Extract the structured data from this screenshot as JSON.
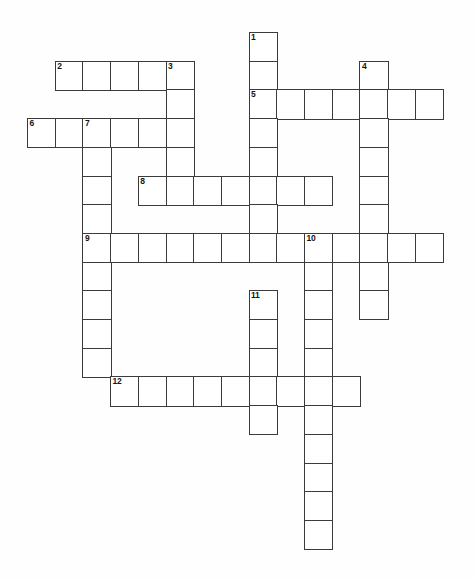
{
  "puzzle": {
    "title": "Crossword Puzzle Grid",
    "type": "crossword-grid",
    "blank": true,
    "grid": {
      "cell_width": 27.7,
      "cell_height": 28.7,
      "origin_x": 27,
      "origin_y": 32,
      "columns": 16,
      "rows": 19,
      "line_color": "#3b3b3b",
      "cell_fill": "#ffffff",
      "background": "#ffffff"
    },
    "entries": [
      {
        "number": "1",
        "direction": "down",
        "col": 8,
        "row": 0,
        "length": 8
      },
      {
        "number": "2",
        "direction": "across",
        "col": 1,
        "row": 1,
        "length": 5
      },
      {
        "number": "3",
        "direction": "down",
        "col": 5,
        "row": 1,
        "length": 5
      },
      {
        "number": "4",
        "direction": "down",
        "col": 12,
        "row": 1,
        "length": 9
      },
      {
        "number": "5",
        "direction": "across",
        "col": 8,
        "row": 2,
        "length": 7
      },
      {
        "number": "6",
        "direction": "across",
        "col": 0,
        "row": 3,
        "length": 6
      },
      {
        "number": "7",
        "direction": "down",
        "col": 2,
        "row": 3,
        "length": 9
      },
      {
        "number": "8",
        "direction": "across",
        "col": 4,
        "row": 5,
        "length": 7
      },
      {
        "number": "9",
        "direction": "across",
        "col": 2,
        "row": 7,
        "length": 13
      },
      {
        "number": "10",
        "direction": "down",
        "col": 10,
        "row": 7,
        "length": 11
      },
      {
        "number": "11",
        "direction": "down",
        "col": 8,
        "row": 9,
        "length": 5
      },
      {
        "number": "12",
        "direction": "across",
        "col": 3,
        "row": 12,
        "length": 9
      }
    ],
    "numbers": [
      "1",
      "2",
      "3",
      "4",
      "5",
      "6",
      "7",
      "8",
      "9",
      "10",
      "11",
      "12"
    ]
  }
}
